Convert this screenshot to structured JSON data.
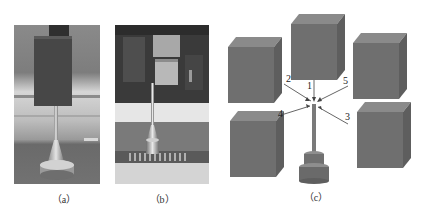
{
  "figure": {
    "panels": [
      {
        "id": "a",
        "caption": "（a）",
        "type": "photo",
        "description": "Probe under a rectangular block, photographed experimental setup"
      },
      {
        "id": "b",
        "caption": "（b）",
        "type": "photo",
        "description": "Probe among blocks with dark background, experimental setup"
      },
      {
        "id": "c",
        "caption": "（c）",
        "type": "diagram",
        "description": "3D model: five cubes around a probe with five numbered incident directions"
      }
    ],
    "diagram_c": {
      "direction_labels": [
        "1",
        "2",
        "3",
        "4",
        "5"
      ],
      "cube_count": 5
    },
    "colors": {
      "cube_front": "#6f6f6f",
      "cube_top": "#8a8a8a",
      "cube_side": "#5e5e5e",
      "probe": "#7a7a7a",
      "arrow": "#555555"
    }
  }
}
